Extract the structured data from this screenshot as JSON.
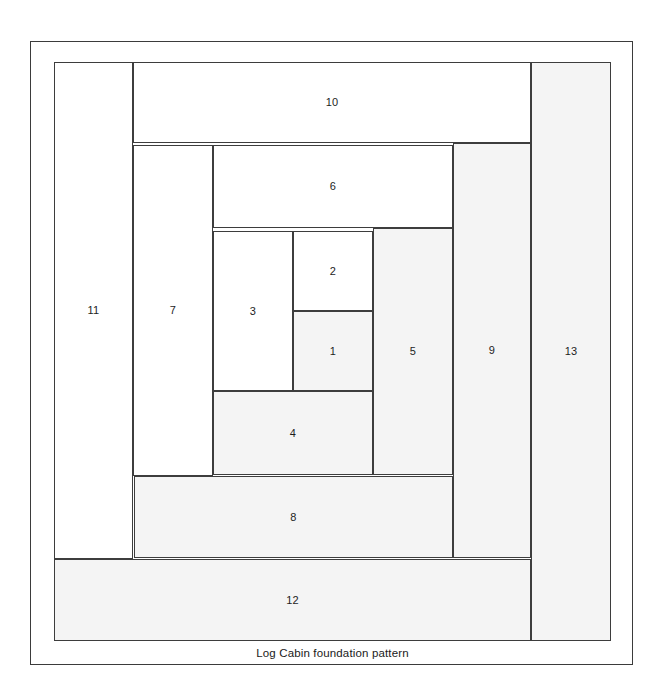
{
  "figure": {
    "caption": "Log Cabin foundation pattern",
    "frame": {
      "border_color": "#3b3b3b",
      "background": "#ffffff"
    },
    "shaded_color": "#f4f4f4",
    "plain_color": "#ffffff",
    "line_color": "#3d3d3d"
  },
  "pattern": {
    "name": "Log Cabin foundation pattern",
    "piece_count": 13,
    "pieces": [
      {
        "label": "1",
        "x": 239,
        "y": 249,
        "w": 80,
        "h": 80,
        "shaded": true
      },
      {
        "label": "2",
        "x": 239,
        "y": 169,
        "w": 80,
        "h": 80,
        "shaded": false
      },
      {
        "label": "3",
        "x": 159,
        "y": 169,
        "w": 80,
        "h": 160,
        "shaded": false
      },
      {
        "label": "4",
        "x": 159,
        "y": 329,
        "w": 160,
        "h": 84,
        "shaded": true
      },
      {
        "label": "5",
        "x": 319,
        "y": 166,
        "w": 80,
        "h": 247,
        "shaded": true
      },
      {
        "label": "6",
        "x": 159,
        "y": 83,
        "w": 240,
        "h": 83,
        "shaded": false
      },
      {
        "label": "7",
        "x": 79,
        "y": 83,
        "w": 80,
        "h": 331,
        "shaded": false
      },
      {
        "label": "8",
        "x": 80,
        "y": 414,
        "w": 319,
        "h": 82,
        "shaded": true
      },
      {
        "label": "9",
        "x": 399,
        "y": 81,
        "w": 78,
        "h": 415,
        "shaded": true
      },
      {
        "label": "10",
        "x": 79,
        "y": 0,
        "w": 398,
        "h": 81,
        "shaded": false
      },
      {
        "label": "11",
        "x": 0,
        "y": 0,
        "w": 79,
        "h": 497,
        "shaded": false
      },
      {
        "label": "12",
        "x": 0,
        "y": 497,
        "w": 477,
        "h": 82,
        "shaded": true
      },
      {
        "label": "13",
        "x": 477,
        "y": 0,
        "w": 80,
        "h": 579,
        "shaded": true
      }
    ]
  },
  "chart_data": {
    "type": "diagram",
    "title": "Log Cabin foundation pattern",
    "block_width_px": 557,
    "block_height_px": 579,
    "pieces": [
      {
        "number": 1,
        "shaded": true,
        "position": "center"
      },
      {
        "number": 2,
        "shaded": false,
        "position": "above-center"
      },
      {
        "number": 3,
        "shaded": false,
        "position": "left-of-center"
      },
      {
        "number": 4,
        "shaded": true,
        "position": "below-center"
      },
      {
        "number": 5,
        "shaded": true,
        "position": "right-of-center"
      },
      {
        "number": 6,
        "shaded": false,
        "position": "top-inner"
      },
      {
        "number": 7,
        "shaded": false,
        "position": "left-inner"
      },
      {
        "number": 8,
        "shaded": true,
        "position": "bottom-inner"
      },
      {
        "number": 9,
        "shaded": true,
        "position": "right-inner"
      },
      {
        "number": 10,
        "shaded": false,
        "position": "top-outer"
      },
      {
        "number": 11,
        "shaded": false,
        "position": "left-outer"
      },
      {
        "number": 12,
        "shaded": true,
        "position": "bottom-outer"
      },
      {
        "number": 13,
        "shaded": true,
        "position": "right-outer"
      }
    ]
  }
}
